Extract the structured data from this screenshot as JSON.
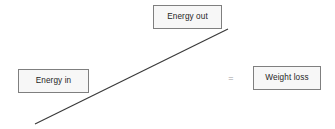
{
  "diagram": {
    "background_color": "#ffffff",
    "nodes": [
      {
        "id": "energy-out",
        "label": "Energy out",
        "fill_color": "#f7f7f7",
        "border_color": "#7f7f7f",
        "text_color": "#262626"
      },
      {
        "id": "energy-in",
        "label": "Energy in",
        "fill_color": "#f7f7f7",
        "border_color": "#7f7f7f",
        "text_color": "#262626"
      },
      {
        "id": "weight-loss",
        "label": "Weight loss",
        "fill_color": "#f7f7f7",
        "border_color": "#7f7f7f",
        "text_color": "#262626"
      }
    ],
    "operator": {
      "symbol": "=",
      "color": "#9a9a9a"
    },
    "connector": {
      "type": "line",
      "color": "#3a3a3a",
      "width": 1.2,
      "x1": 35,
      "y1": 124,
      "x2": 228,
      "y2": 29
    }
  }
}
